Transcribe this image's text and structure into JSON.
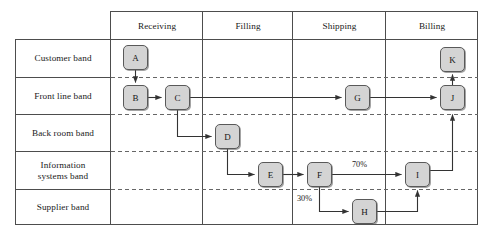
{
  "diagram": {
    "type": "swimlane-flowchart",
    "colors": {
      "node_fill": "#d4d4d4",
      "node_stroke": "#595959",
      "grid_solid": "#4d4d4d",
      "grid_dashed": "#666666",
      "arrow": "#333333",
      "text": "#1a1a1a",
      "background": "#ffffff"
    },
    "columns": [
      {
        "id": "receiving",
        "label": "Receiving"
      },
      {
        "id": "filling",
        "label": "Filling"
      },
      {
        "id": "shipping",
        "label": "Shipping"
      },
      {
        "id": "billing",
        "label": "Billing"
      }
    ],
    "bands": [
      {
        "id": "customer",
        "label": "Customer band"
      },
      {
        "id": "front-line",
        "label": "Front line band"
      },
      {
        "id": "back-room",
        "label": "Back room band"
      },
      {
        "id": "information-systems",
        "label": "Information\nsystems band"
      },
      {
        "id": "supplier",
        "label": "Supplier band"
      }
    ],
    "nodes": [
      {
        "id": "A",
        "label": "A",
        "column": "receiving",
        "band": "customer"
      },
      {
        "id": "B",
        "label": "B",
        "column": "receiving",
        "band": "front-line"
      },
      {
        "id": "C",
        "label": "C",
        "column": "receiving",
        "band": "front-line"
      },
      {
        "id": "D",
        "label": "D",
        "column": "filling",
        "band": "back-room"
      },
      {
        "id": "E",
        "label": "E",
        "column": "filling",
        "band": "information-systems"
      },
      {
        "id": "F",
        "label": "F",
        "column": "shipping",
        "band": "information-systems"
      },
      {
        "id": "G",
        "label": "G",
        "column": "shipping",
        "band": "front-line"
      },
      {
        "id": "H",
        "label": "H",
        "column": "shipping",
        "band": "supplier"
      },
      {
        "id": "I",
        "label": "I",
        "column": "billing",
        "band": "information-systems"
      },
      {
        "id": "J",
        "label": "J",
        "column": "billing",
        "band": "front-line"
      },
      {
        "id": "K",
        "label": "K",
        "column": "billing",
        "band": "customer"
      }
    ],
    "edges": [
      {
        "from": "A",
        "to": "B",
        "label": ""
      },
      {
        "from": "B",
        "to": "C",
        "label": ""
      },
      {
        "from": "C",
        "to": "G",
        "label": ""
      },
      {
        "from": "C",
        "to": "D",
        "label": ""
      },
      {
        "from": "D",
        "to": "E",
        "label": ""
      },
      {
        "from": "E",
        "to": "F",
        "label": ""
      },
      {
        "from": "F",
        "to": "I",
        "label": "70%"
      },
      {
        "from": "F",
        "to": "H",
        "label": "30%"
      },
      {
        "from": "H",
        "to": "I",
        "label": ""
      },
      {
        "from": "G",
        "to": "J",
        "label": ""
      },
      {
        "from": "I",
        "to": "J",
        "label": ""
      },
      {
        "from": "J",
        "to": "K",
        "label": ""
      }
    ],
    "edge_labels": [
      {
        "id": "pct-70",
        "text": "70%"
      },
      {
        "id": "pct-30",
        "text": "30%"
      }
    ]
  }
}
